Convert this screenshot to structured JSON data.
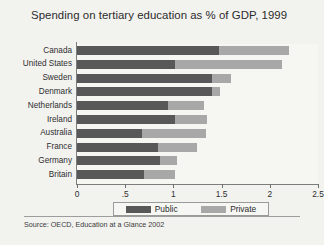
{
  "chart_data": {
    "type": "bar",
    "orientation": "horizontal",
    "stacked": true,
    "title": "Spending on tertiary education as % of GDP, 1999",
    "xlabel": "",
    "ylabel": "",
    "xlim": [
      0,
      2.5
    ],
    "grid": false,
    "legend_position": "bottom",
    "categories": [
      "Canada",
      "United States",
      "Sweden",
      "Denmark",
      "Netherlands",
      "Ireland",
      "Australia",
      "France",
      "Germany",
      "Britain"
    ],
    "xticks": [
      0,
      0.5,
      1,
      1.5,
      2,
      2.5
    ],
    "xtick_labels": [
      "0",
      ".5",
      "1",
      "1.5",
      "2",
      "2.5"
    ],
    "series": [
      {
        "name": "Public",
        "color": "#585858",
        "values": [
          1.47,
          1.02,
          1.4,
          1.4,
          0.94,
          1.02,
          0.67,
          0.84,
          0.86,
          0.69
        ]
      },
      {
        "name": "Private",
        "color": "#a8a8a8",
        "values": [
          0.73,
          1.11,
          0.2,
          0.08,
          0.38,
          0.33,
          0.67,
          0.4,
          0.18,
          0.33
        ]
      }
    ],
    "totals": [
      2.2,
      2.13,
      1.6,
      1.48,
      1.32,
      1.35,
      1.34,
      1.24,
      1.04,
      1.02
    ],
    "source": "Source:  OECD, Education at a Glance 2002"
  },
  "legend": {
    "items": [
      {
        "label": "Public",
        "color": "#585858"
      },
      {
        "label": "Private",
        "color": "#a8a8a8"
      }
    ]
  }
}
